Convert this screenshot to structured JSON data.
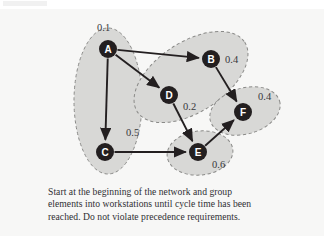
{
  "figure": {
    "caption_lines": [
      "Start at the beginning of the network and group",
      "elements into workstations until cycle time has been",
      "reached. Do not violate precedence requirements."
    ],
    "background_color": "#f7f7f6"
  },
  "chart_data": {
    "type": "diagram",
    "title": "",
    "subtitle": "",
    "xlabel": "",
    "ylabel": "",
    "legend": [],
    "grid": false,
    "nodes": [
      {
        "id": "A",
        "label": "A",
        "time": "0.1",
        "x": 95,
        "y": 38,
        "time_x": 84,
        "time_y": 20
      },
      {
        "id": "B",
        "label": "B",
        "time": "0.4",
        "x": 198,
        "y": 48,
        "time_x": 212,
        "time_y": 52
      },
      {
        "id": "C",
        "label": "C",
        "time": "0.5",
        "x": 92,
        "y": 141,
        "time_x": 113,
        "time_y": 125
      },
      {
        "id": "D",
        "label": "D",
        "time": "0.2",
        "x": 156,
        "y": 84,
        "time_x": 170,
        "time_y": 99
      },
      {
        "id": "E",
        "label": "E",
        "time": "0.6",
        "x": 185,
        "y": 141,
        "time_x": 199,
        "time_y": 157
      },
      {
        "id": "F",
        "label": "F",
        "time": "0.4",
        "x": 230,
        "y": 101,
        "time_x": 245,
        "time_y": 89
      }
    ],
    "edges": [
      {
        "from": "A",
        "to": "B"
      },
      {
        "from": "A",
        "to": "C"
      },
      {
        "from": "A",
        "to": "D"
      },
      {
        "from": "B",
        "to": "F"
      },
      {
        "from": "C",
        "to": "E"
      },
      {
        "from": "D",
        "to": "E"
      },
      {
        "from": "E",
        "to": "F"
      }
    ],
    "workstation_groups": [
      {
        "name": "workstation-1",
        "members": [
          "A",
          "C"
        ],
        "cx": 95,
        "cy": 90,
        "rx": 34,
        "ry": 73,
        "rotate": 0
      },
      {
        "name": "workstation-2",
        "members": [
          "B",
          "D"
        ],
        "cx": 178,
        "cy": 66,
        "rx": 64,
        "ry": 35,
        "rotate": -33
      },
      {
        "name": "workstation-3",
        "members": [
          "F"
        ],
        "cx": 232,
        "cy": 100,
        "rx": 36,
        "ry": 23,
        "rotate": -16
      },
      {
        "name": "workstation-4",
        "members": [
          "E"
        ],
        "cx": 187,
        "cy": 142,
        "rx": 33,
        "ry": 22,
        "rotate": -6
      }
    ],
    "node_fill": "#231f20",
    "node_text_color": "#ffffff",
    "group_fill": "#d8d8d6",
    "group_stroke": "#8a8a88",
    "edge_color": "#231f20",
    "node_radius": 9
  }
}
